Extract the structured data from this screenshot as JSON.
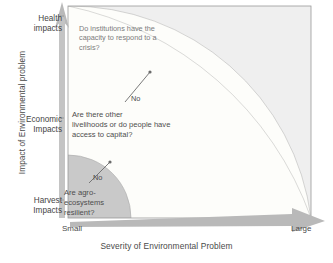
{
  "figure": {
    "title_present": false,
    "axes": {
      "y": {
        "label": "Impact of Environmental problem",
        "ticks": [
          {
            "id": "health",
            "label": "Health\nimpacts"
          },
          {
            "id": "economic",
            "label": "Economic\nImpacts"
          },
          {
            "id": "harvest",
            "label": "Harvest\nImpacts"
          }
        ]
      },
      "x": {
        "label": "Severity of Environmental Problem",
        "ticks": [
          {
            "id": "small",
            "label": "Small"
          },
          {
            "id": "large",
            "label": "Large"
          }
        ]
      }
    },
    "zones": [
      {
        "id": "inner",
        "name": "agro-ecosystem-resilience-zone",
        "color": "#c9c9c9",
        "question": "Are agro-\necosystems\nresilient?",
        "answer_label": "No"
      },
      {
        "id": "middle",
        "name": "livelihoods-capital-zone",
        "color": "#fdfdfa",
        "question": "Are there other\nlivelihoods or do people have\naccess to capital?",
        "answer_label": "No"
      },
      {
        "id": "outer",
        "name": "institutional-capacity-zone",
        "color": "#8c8c8c",
        "question": "Do institutions have the\ncapacity to respond to a\ncrisis?",
        "answer_label": ""
      }
    ],
    "annotations": [
      {
        "id": "no-outer",
        "label": "No"
      },
      {
        "id": "no-inner",
        "label": "No"
      }
    ],
    "colors": {
      "zone_inner": "#c9c9c9",
      "zone_middle": "#fdfdfa",
      "zone_outer": "#8c8c8c",
      "plot_background": "#efefef",
      "axis_arrow": "#b5b5b5",
      "text": "#4a4a4a",
      "faint_text": "#7c7c7c"
    }
  }
}
